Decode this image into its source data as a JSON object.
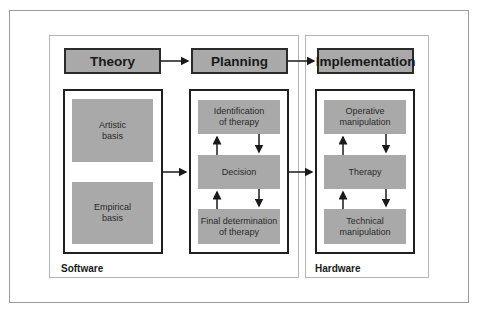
{
  "diagram": {
    "columns": [
      {
        "header": "Theory",
        "items": [
          "Artistic\nbasis",
          "Empirical\nbasis"
        ]
      },
      {
        "header": "Planning",
        "items": [
          "Identification\nof therapy",
          "Decision",
          "Final determination\nof therapy"
        ]
      },
      {
        "header": "Implementation",
        "items": [
          "Operative\nmanipulation",
          "Therapy",
          "Technical\nmanipulation"
        ]
      }
    ],
    "panels": {
      "software": "Software",
      "hardware": "Hardware"
    },
    "colors": {
      "box_fill": "#a9a9a9",
      "border": "#1f1f1f",
      "panel_border": "#b5b5b5"
    }
  }
}
